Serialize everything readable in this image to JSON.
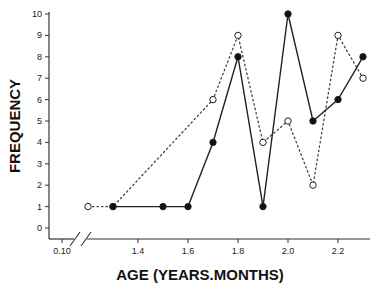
{
  "chart_data": {
    "type": "line",
    "title": "",
    "xlabel": "AGE (YEARS.MONTHS)",
    "ylabel": "FREQUENCY",
    "ylim": [
      0,
      10
    ],
    "y_ticks": [
      "0",
      "1",
      "2",
      "3",
      "4",
      "5",
      "6",
      "7",
      "8",
      "9",
      "10"
    ],
    "x_tick_labels": [
      {
        "label": "0.10",
        "x": 0.1
      },
      {
        "label": "1.4",
        "x": 1.4
      },
      {
        "label": "1.6",
        "x": 1.6
      },
      {
        "label": "1.8",
        "x": 1.8
      },
      {
        "label": "2.0",
        "x": 2.0
      },
      {
        "label": "2.2",
        "x": 2.2
      }
    ],
    "axis_break": "between 0.10 and 1.2",
    "grid": false,
    "legend": null,
    "series": [
      {
        "name": "filled-circles",
        "style": "solid line, filled circle markers",
        "x": [
          1.3,
          1.5,
          1.6,
          1.7,
          1.8,
          1.9,
          2.0,
          2.1,
          2.2,
          2.3
        ],
        "values": [
          1,
          1,
          1,
          4,
          8,
          1,
          10,
          5,
          6,
          8
        ]
      },
      {
        "name": "open-circles",
        "style": "dotted line, open circle markers",
        "x": [
          1.2,
          1.3,
          1.7,
          1.8,
          1.9,
          2.0,
          2.1,
          2.2,
          2.3
        ],
        "values": [
          1,
          1,
          6,
          9,
          4,
          5,
          2,
          9,
          7
        ]
      }
    ]
  },
  "labels": {
    "x_axis_title": "AGE (YEARS.MONTHS)",
    "y_axis_title": "FREQUENCY"
  }
}
